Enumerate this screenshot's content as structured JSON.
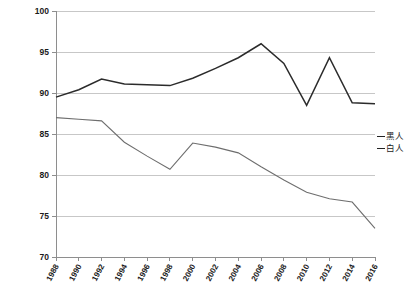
{
  "chart_data": {
    "type": "line",
    "title": "",
    "xlabel": "",
    "ylabel": "",
    "grid": true,
    "legend_position": "right",
    "x": [
      "1988",
      "1990",
      "1992",
      "1994",
      "1996",
      "1998",
      "2000",
      "2002",
      "2004",
      "2006",
      "2008",
      "2010",
      "2012",
      "2014",
      "2016"
    ],
    "ylim": [
      70,
      100
    ],
    "yticks": [
      "70",
      "75",
      "80",
      "85",
      "90",
      "95",
      "100"
    ],
    "series": [
      {
        "name": "黑人",
        "color": "#2b2b2b",
        "width": 1.5,
        "values": [
          89.5,
          90.4,
          91.7,
          91.1,
          91.0,
          90.9,
          91.8,
          93.0,
          94.3,
          96.0,
          93.6,
          88.5,
          94.3,
          88.8,
          88.7
        ]
      },
      {
        "name": "白人",
        "color": "#6e6e6e",
        "width": 1.1,
        "values": [
          87.0,
          86.8,
          86.6,
          84.0,
          82.3,
          80.7,
          83.9,
          83.4,
          82.7,
          81.0,
          79.4,
          77.9,
          77.1,
          76.7,
          73.5
        ]
      }
    ]
  },
  "legend": {
    "items": [
      {
        "label": "黑人"
      },
      {
        "label": "白人"
      }
    ]
  },
  "axes": {
    "y_labels": [
      "100",
      "95",
      "90",
      "85",
      "80",
      "75",
      "70"
    ],
    "x_labels": [
      "1988",
      "1990",
      "1992",
      "1994",
      "1996",
      "1998",
      "2000",
      "2002",
      "2004",
      "2006",
      "2008",
      "2010",
      "2012",
      "2014",
      "2016"
    ]
  }
}
